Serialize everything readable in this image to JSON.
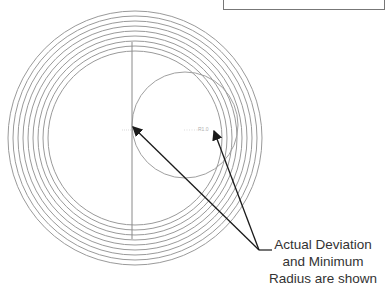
{
  "diagram": {
    "rings": {
      "count": 9,
      "center": [
        135,
        138
      ],
      "outer_radius": 127,
      "spacing": 5,
      "color": "#9a9a9a"
    },
    "offset_circle": {
      "center": [
        185,
        125
      ],
      "radius": 53,
      "color": "#a0a0a0"
    },
    "vertical_line": {
      "x": 132,
      "y1": 42,
      "y2": 239,
      "color": "#8a8a8a"
    },
    "small_labels": {
      "radius_label": "R1.0"
    },
    "arrows": [
      {
        "from": [
          259,
          250
        ],
        "to": [
          133,
          127
        ]
      },
      {
        "from": [
          259,
          250
        ],
        "to": [
          214,
          131
        ]
      }
    ],
    "leader_line": {
      "from": [
        259,
        250
      ],
      "to": [
        272,
        250
      ]
    },
    "callout": {
      "line1": "Actual Deviation",
      "line2": "and Minimum",
      "line3": "Radius are shown"
    },
    "colors": {
      "arrow": "#1a1a1a",
      "text": "#333333"
    }
  }
}
